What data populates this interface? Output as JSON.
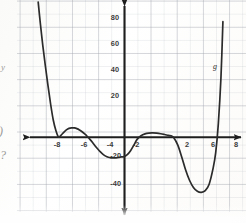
{
  "document": {
    "kind": "scanned-worksheet-graph",
    "background_color": "#fdfdfc",
    "grid_color": "#a0a4ac",
    "curve_color": "#2b2b2b",
    "axis_color": "#1e1e1e"
  },
  "margin_fragments": [
    {
      "name": "fragment-y",
      "text": "y",
      "x": 1,
      "y": 66
    },
    {
      "name": "fragment-paren",
      "text": ")",
      "x": 0,
      "y": 128
    },
    {
      "name": "fragment-question",
      "text": "?",
      "x": 1,
      "y": 153
    }
  ],
  "graph": {
    "function_label": "g",
    "function_label_x": 213,
    "function_label_y": 66,
    "origin": {
      "x": 124,
      "y": 137
    },
    "unit_px_x": 13.1,
    "unit_px_y": 1.31,
    "x_axis": {
      "label": "x",
      "ticks": [
        -8,
        -6,
        -4,
        -2,
        2,
        6,
        8
      ],
      "tick_labels": [
        "-8",
        "-6",
        "-4",
        "-2",
        "2",
        "6",
        "8"
      ],
      "range": [
        -9.4,
        9.2
      ],
      "arrows": "both"
    },
    "y_axis": {
      "label": "y",
      "ticks": [
        80,
        60,
        40,
        20,
        -20,
        -40
      ],
      "tick_labels": [
        "80",
        "60",
        "40",
        "20",
        "-20",
        "-40"
      ],
      "range": [
        -62,
        102
      ],
      "arrows": "both"
    }
  },
  "chart_data": {
    "type": "line",
    "title": "",
    "xlabel": "x",
    "ylabel": "y",
    "series_name": "g",
    "xlim": [
      -9.4,
      9.2
    ],
    "ylim": [
      -62,
      102
    ],
    "grid": true,
    "legend": "none",
    "roots": [
      -5,
      -2,
      1,
      3.6,
      7
    ],
    "tangent_roots": [
      -5,
      3.6
    ],
    "local_maxima": [
      {
        "x": -3.5,
        "y": 7
      },
      {
        "x": 3.6,
        "y": 1
      }
    ],
    "local_minima": [
      {
        "x": -5,
        "y": 0
      },
      {
        "x": -0.35,
        "y": -16
      },
      {
        "x": 6.0,
        "y": -42
      }
    ],
    "y_intercept": -15,
    "end_behavior": {
      "left": "up",
      "right": "up"
    },
    "degree": 6,
    "x": [
      -6.55,
      -6.4,
      -6.2,
      -6.0,
      -5.8,
      -5.6,
      -5.4,
      -5.2,
      -5.0,
      -4.8,
      -4.6,
      -4.4,
      -4.2,
      -4.0,
      -3.8,
      -3.6,
      -3.4,
      -3.2,
      -3.0,
      -2.8,
      -2.6,
      -2.4,
      -2.2,
      -2.0,
      -1.8,
      -1.6,
      -1.4,
      -1.2,
      -1.0,
      -0.8,
      -0.6,
      -0.4,
      -0.2,
      0.0,
      0.25,
      0.5,
      0.75,
      1.0,
      1.3,
      1.6,
      1.9,
      2.2,
      2.5,
      2.8,
      3.1,
      3.4,
      3.6,
      3.8,
      4.1,
      4.4,
      4.7,
      5.0,
      5.3,
      5.6,
      5.9,
      6.2,
      6.5,
      6.8,
      7.0,
      7.2,
      7.4,
      7.55
    ],
    "y": [
      103,
      88,
      70,
      54,
      39,
      25,
      13,
      5,
      0,
      1.5,
      3.6,
      5.4,
      6.6,
      7.0,
      6.9,
      6.4,
      5.4,
      4.0,
      2.3,
      0.4,
      -1.8,
      -4.2,
      -6.8,
      -9.2,
      -11.4,
      -13.2,
      -14.6,
      -15.5,
      -15.9,
      -16.0,
      -15.9,
      -15.6,
      -15.2,
      -15.0,
      -13.5,
      -10.5,
      -6.2,
      -1.8,
      1.0,
      2.4,
      3.0,
      3.1,
      2.9,
      2.5,
      1.9,
      1.2,
      0.9,
      -0.5,
      -6.0,
      -15.0,
      -25.0,
      -33.0,
      -38.5,
      -41.4,
      -42.2,
      -41.0,
      -36.0,
      -24.0,
      -12.0,
      10.0,
      45.0,
      88.0
    ]
  }
}
